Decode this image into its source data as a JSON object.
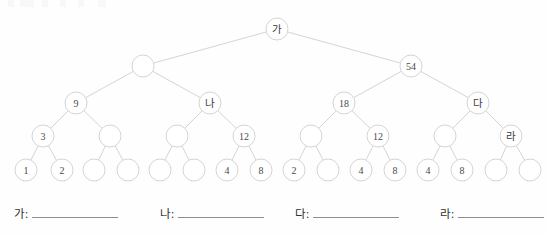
{
  "worksheet": {
    "title_fragment": "",
    "background_color": "#fefefe",
    "edge_color": "#c9c9c9",
    "node_stroke_color": "#cfcfcf",
    "node_fill_color": "#ffffff",
    "text_color": "#4a4a4a",
    "blank_line_color": "#8d8d8d"
  },
  "tree": {
    "type": "binary-tree",
    "depth": 5,
    "radius": 11,
    "levels": [
      {
        "level": 0,
        "y": 29,
        "nodes": [
          {
            "id": "n0",
            "label": "가",
            "is_hangul": true,
            "x": 277
          }
        ]
      },
      {
        "level": 1,
        "y": 66,
        "nodes": [
          {
            "id": "n1",
            "label": "",
            "is_hangul": false,
            "x": 143
          },
          {
            "id": "n2",
            "label": "54",
            "is_hangul": false,
            "x": 411
          }
        ]
      },
      {
        "level": 2,
        "y": 103,
        "nodes": [
          {
            "id": "n3",
            "label": "9",
            "is_hangul": false,
            "x": 76
          },
          {
            "id": "n4",
            "label": "나",
            "is_hangul": true,
            "x": 210
          },
          {
            "id": "n5",
            "label": "18",
            "is_hangul": false,
            "x": 344
          },
          {
            "id": "n6",
            "label": "다",
            "is_hangul": true,
            "x": 478
          }
        ]
      },
      {
        "level": 3,
        "y": 136,
        "nodes": [
          {
            "id": "n7",
            "label": "3",
            "is_hangul": false,
            "x": 43
          },
          {
            "id": "n8",
            "label": "",
            "is_hangul": false,
            "x": 110
          },
          {
            "id": "n9",
            "label": "",
            "is_hangul": false,
            "x": 177
          },
          {
            "id": "n10",
            "label": "12",
            "is_hangul": false,
            "x": 244
          },
          {
            "id": "n11",
            "label": "",
            "is_hangul": false,
            "x": 311
          },
          {
            "id": "n12",
            "label": "12",
            "is_hangul": false,
            "x": 378
          },
          {
            "id": "n13",
            "label": "",
            "is_hangul": false,
            "x": 445
          },
          {
            "id": "n14",
            "label": "라",
            "is_hangul": true,
            "x": 511
          }
        ]
      },
      {
        "level": 4,
        "y": 170,
        "nodes": [
          {
            "id": "n15",
            "label": "1",
            "is_hangul": false,
            "x": 26
          },
          {
            "id": "n16",
            "label": "2",
            "is_hangul": false,
            "x": 62
          },
          {
            "id": "n17",
            "label": "",
            "is_hangul": false,
            "x": 94
          },
          {
            "id": "n18",
            "label": "",
            "is_hangul": false,
            "x": 128
          },
          {
            "id": "n19",
            "label": "",
            "is_hangul": false,
            "x": 160
          },
          {
            "id": "n20",
            "label": "",
            "is_hangul": false,
            "x": 194
          },
          {
            "id": "n21",
            "label": "4",
            "is_hangul": false,
            "x": 227
          },
          {
            "id": "n22",
            "label": "8",
            "is_hangul": false,
            "x": 261
          },
          {
            "id": "n23",
            "label": "2",
            "is_hangul": false,
            "x": 294
          },
          {
            "id": "n24",
            "label": "",
            "is_hangul": false,
            "x": 328
          },
          {
            "id": "n25",
            "label": "4",
            "is_hangul": false,
            "x": 361
          },
          {
            "id": "n26",
            "label": "8",
            "is_hangul": false,
            "x": 395
          },
          {
            "id": "n27",
            "label": "4",
            "is_hangul": false,
            "x": 428
          },
          {
            "id": "n28",
            "label": "8",
            "is_hangul": false,
            "x": 462
          },
          {
            "id": "n29",
            "label": "",
            "is_hangul": false,
            "x": 496
          },
          {
            "id": "n30",
            "label": "",
            "is_hangul": false,
            "x": 530
          }
        ]
      }
    ],
    "edges": [
      [
        "n0",
        "n1"
      ],
      [
        "n0",
        "n2"
      ],
      [
        "n1",
        "n3"
      ],
      [
        "n1",
        "n4"
      ],
      [
        "n2",
        "n5"
      ],
      [
        "n2",
        "n6"
      ],
      [
        "n3",
        "n7"
      ],
      [
        "n3",
        "n8"
      ],
      [
        "n4",
        "n9"
      ],
      [
        "n4",
        "n10"
      ],
      [
        "n5",
        "n11"
      ],
      [
        "n5",
        "n12"
      ],
      [
        "n6",
        "n13"
      ],
      [
        "n6",
        "n14"
      ],
      [
        "n7",
        "n15"
      ],
      [
        "n7",
        "n16"
      ],
      [
        "n8",
        "n17"
      ],
      [
        "n8",
        "n18"
      ],
      [
        "n9",
        "n19"
      ],
      [
        "n9",
        "n20"
      ],
      [
        "n10",
        "n21"
      ],
      [
        "n10",
        "n22"
      ],
      [
        "n11",
        "n23"
      ],
      [
        "n11",
        "n24"
      ],
      [
        "n12",
        "n25"
      ],
      [
        "n12",
        "n26"
      ],
      [
        "n13",
        "n27"
      ],
      [
        "n13",
        "n28"
      ],
      [
        "n14",
        "n29"
      ],
      [
        "n14",
        "n30"
      ]
    ]
  },
  "answers": {
    "slots": [
      {
        "id": "answer-ga",
        "label": "가:",
        "value": "",
        "x": 14
      },
      {
        "id": "answer-na",
        "label": "나:",
        "value": "",
        "x": 160
      },
      {
        "id": "answer-da",
        "label": "다:",
        "value": "",
        "x": 295
      },
      {
        "id": "answer-ra",
        "label": "라:",
        "value": "",
        "x": 440
      }
    ]
  }
}
